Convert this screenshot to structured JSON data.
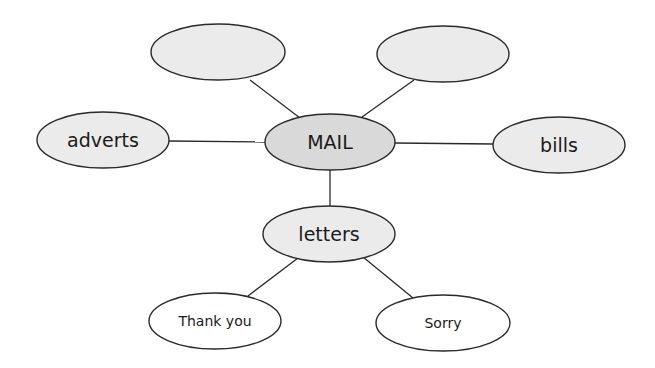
{
  "diagram": {
    "type": "mind-map",
    "colors": {
      "background": "#ffffff",
      "node_grey": "#ebebeb",
      "node_center": "#d9d9d9",
      "node_white": "#ffffff",
      "stroke": "#2a2a2a"
    },
    "nodes": {
      "center": {
        "label": "MAIL"
      },
      "top_left": {
        "label": ""
      },
      "top_right": {
        "label": ""
      },
      "left": {
        "label": "adverts"
      },
      "right": {
        "label": "bills"
      },
      "bottom": {
        "label": "letters"
      },
      "bottom_left": {
        "label": "Thank you"
      },
      "bottom_right": {
        "label": "Sorry"
      }
    },
    "edges": [
      [
        "center",
        "top_left"
      ],
      [
        "center",
        "top_right"
      ],
      [
        "center",
        "left"
      ],
      [
        "center",
        "right"
      ],
      [
        "center",
        "bottom"
      ],
      [
        "bottom",
        "bottom_left"
      ],
      [
        "bottom",
        "bottom_right"
      ]
    ]
  }
}
